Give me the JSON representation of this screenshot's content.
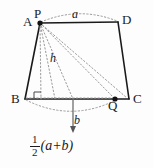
{
  "figure": {
    "type": "geometry-diagram",
    "background_color": "#fdfdfd",
    "stroke_color": "#1a1a1a",
    "dotted_color": "#8a8a8a",
    "vertices": [
      {
        "name": "A",
        "label": "A",
        "x": 40,
        "y": 23
      },
      {
        "name": "P",
        "label": "P",
        "x": 40,
        "y": 23
      },
      {
        "name": "D",
        "label": "D",
        "x": 118,
        "y": 22
      },
      {
        "name": "B",
        "label": "B",
        "x": 25,
        "y": 99
      },
      {
        "name": "C",
        "label": "C",
        "x": 129,
        "y": 99
      },
      {
        "name": "Q",
        "label": "Q",
        "x": 115,
        "y": 99
      }
    ],
    "measures": {
      "top_arc_label": "a",
      "bottom_arc_label": "b",
      "height_label": "h"
    },
    "formula": {
      "numerator": "1",
      "denominator": "2",
      "expression": "(a+b)"
    },
    "markers": {
      "right_angle": "right-angle-marker",
      "arrow": "down-arrow"
    }
  }
}
